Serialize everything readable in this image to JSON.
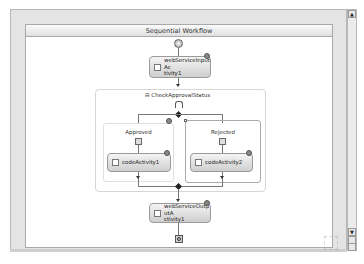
{
  "designer": {
    "title": "Sequential Workflow"
  },
  "activities": {
    "input": {
      "label": "webServiceInputActivity1",
      "line1": "webServiceInputAc",
      "line2": "tivity1"
    },
    "ifelse": {
      "label": "CheckApprovalStatus",
      "collapse_glyph": "⊟"
    },
    "approved_branch": {
      "label": "Approved"
    },
    "rejected_branch": {
      "label": "Rejected"
    },
    "code1": {
      "label": "codeActivity1"
    },
    "code2": {
      "label": "codeActivity2"
    },
    "output": {
      "label": "webServiceOutputActivity1",
      "line1": "webServiceOutputA",
      "line2": "ctivity1"
    }
  },
  "scrollbar": {
    "up_glyph": "▲",
    "down_glyph": "▼"
  },
  "colors": {
    "frame": "#e4e4e4",
    "canvas": "#ffffff",
    "activity_top": "#f4f4f4",
    "activity_bottom": "#cfcfcf"
  }
}
